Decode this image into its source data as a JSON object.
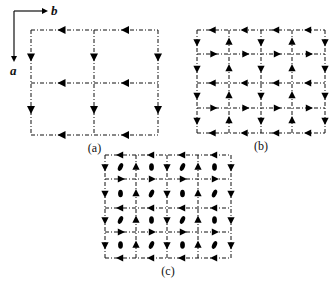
{
  "axes": {
    "b_label": "b",
    "a_label": "a"
  },
  "panels": [
    {
      "label": "(a)",
      "columns_x": [
        31,
        94,
        158
      ],
      "rows_y": [
        30,
        83,
        135
      ],
      "row_directions": [
        "left",
        "left",
        "left"
      ],
      "column_directions": [
        "down",
        "down",
        "down"
      ],
      "ellipses": []
    },
    {
      "label": "(b)",
      "columns_x": [
        197,
        229,
        261,
        292,
        325
      ],
      "rows_y": [
        30,
        54,
        83,
        108,
        133
      ],
      "row_directions": [
        "left",
        "right",
        "left",
        "right",
        "left"
      ],
      "column_directions": [
        "down",
        "up",
        "down",
        "up",
        "down"
      ],
      "ellipses": []
    },
    {
      "label": "(c)",
      "columns_x": [
        105,
        136,
        167,
        198,
        231
      ],
      "rows_y": [
        155,
        179,
        208,
        232,
        258
      ],
      "row_directions": [
        "left",
        "right",
        "left",
        "right",
        "left"
      ],
      "column_directions": [
        "down",
        "up",
        "down",
        "up",
        "down"
      ],
      "ellipses": [
        [
          "tilted",
          "upright",
          "tilted",
          "upright"
        ],
        [
          "upright",
          "tilted",
          "upright",
          "tilted"
        ],
        [
          "tilted",
          "upright",
          "tilted",
          "upright"
        ],
        [
          "upright",
          "tilted",
          "upright",
          "tilted"
        ]
      ]
    }
  ]
}
